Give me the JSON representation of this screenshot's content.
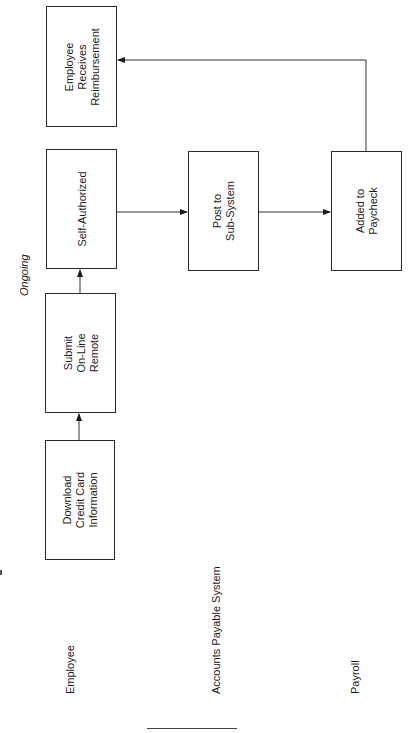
{
  "diagram": {
    "orientation": "rotated-90-ccw",
    "note": "Ongoing",
    "lanes": [
      {
        "id": "employee",
        "label": "Employee"
      },
      {
        "id": "ap",
        "label": "Accounts Payable System"
      },
      {
        "id": "payroll",
        "label": "Payroll"
      }
    ],
    "nodes": [
      {
        "id": "download",
        "lane": "employee",
        "label": "Download\nCredit Card\nInformation"
      },
      {
        "id": "submit",
        "lane": "employee",
        "label": "Submit\nOn-Line\nRemote"
      },
      {
        "id": "selfauth",
        "lane": "employee",
        "label": "Self-Authorized"
      },
      {
        "id": "receive",
        "lane": "employee",
        "label": "Employee\nReceives\nReimbursement"
      },
      {
        "id": "post",
        "lane": "ap",
        "label": "Post to\nSub-System"
      },
      {
        "id": "paycheck",
        "lane": "payroll",
        "label": "Added to\nPaycheck"
      }
    ],
    "edges": [
      {
        "from": "download",
        "to": "submit"
      },
      {
        "from": "submit",
        "to": "selfauth"
      },
      {
        "from": "selfauth",
        "to": "post"
      },
      {
        "from": "post",
        "to": "paycheck"
      },
      {
        "from": "paycheck",
        "to": "receive"
      }
    ],
    "colors": {
      "stroke": "#2a2a2a",
      "text": "#1a1a1a",
      "background": "#ffffff"
    }
  }
}
